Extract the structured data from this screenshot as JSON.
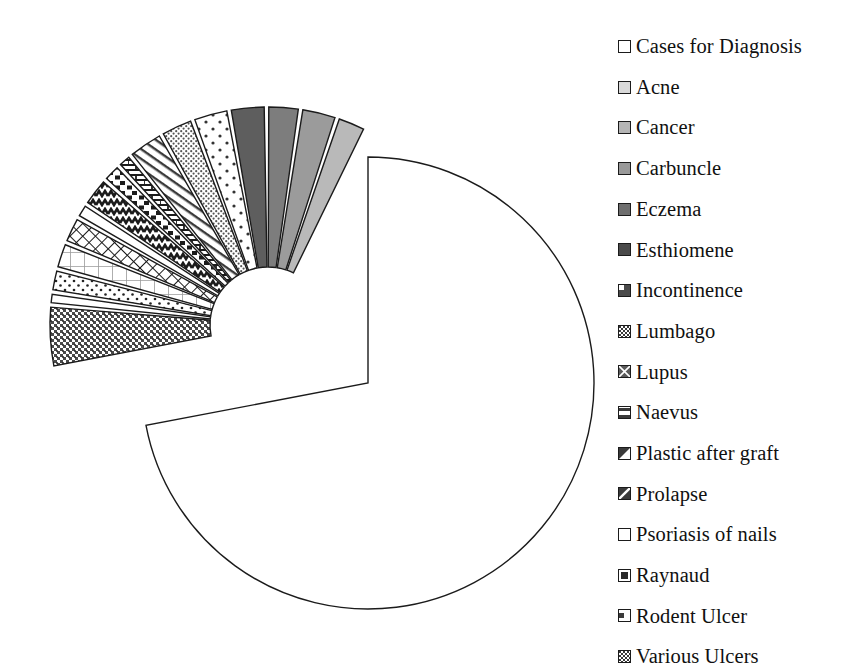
{
  "chart_data": {
    "type": "pie",
    "title": "",
    "xlabel": "",
    "ylabel": "",
    "legend_position": "right",
    "grid": false,
    "exploded": true,
    "start_angle_deg": 0,
    "direction": "clockwise",
    "categories": [
      "Cases for Diagnosis",
      "Acne",
      "Cancer",
      "Carbuncle",
      "Eczema",
      "Esthiomene",
      "Incontinence",
      "Lumbago",
      "Lupus",
      "Naevus",
      "Plastic after graft",
      "Prolapse",
      "Psoriasis of nails",
      "Raynaud",
      "Rodent Ulcer",
      "Various Ulcers"
    ],
    "values": [
      72.0,
      1.9,
      2.2,
      2.4,
      2.6,
      2.2,
      2.4,
      0.8,
      1.1,
      1.9,
      0.8,
      1.7,
      1.7,
      1.4,
      0.6,
      4.3
    ],
    "units": "percent"
  },
  "chart": {
    "center_x": 368,
    "center_y": 383,
    "radius": 226,
    "explode_center_x": 268,
    "explode_center_y": 325,
    "explode_radius": 218,
    "inner_gap": 58,
    "slices": [
      {
        "name": "Cases for Diagnosis",
        "start": 0,
        "end": 259.2,
        "fill": "white",
        "exploded": false
      },
      {
        "name": "Various Ulcers",
        "start": 259.2,
        "end": 274.7,
        "fill": "checker",
        "exploded": true
      },
      {
        "name": "Rodent Ulcer",
        "start": 275.9,
        "end": 278.1,
        "fill": "white",
        "exploded": true
      },
      {
        "name": "Raynaud",
        "start": 279.3,
        "end": 284.3,
        "fill": "dots-dense",
        "exploded": true
      },
      {
        "name": "Psoriasis of nails",
        "start": 285.5,
        "end": 291.6,
        "fill": "grid-light",
        "exploded": true
      },
      {
        "name": "Prolapse",
        "start": 292.8,
        "end": 298.9,
        "fill": "lattice",
        "exploded": true
      },
      {
        "name": "Plastic after graft",
        "start": 300.1,
        "end": 303.0,
        "fill": "white",
        "exploded": true
      },
      {
        "name": "Naevus",
        "start": 304.2,
        "end": 311.0,
        "fill": "zigzag",
        "exploded": true
      },
      {
        "name": "Lupus",
        "start": 312.2,
        "end": 316.2,
        "fill": "dash",
        "exploded": true
      },
      {
        "name": "Lumbago",
        "start": 317.4,
        "end": 320.3,
        "fill": "brick",
        "exploded": true
      },
      {
        "name": "Incontinence",
        "start": 321.5,
        "end": 330.1,
        "fill": "diag-line",
        "exploded": true
      },
      {
        "name": "Esthiomene",
        "start": 331.3,
        "end": 339.2,
        "fill": "stipple",
        "exploded": true
      },
      {
        "name": "Eczema",
        "start": 340.4,
        "end": 349.1,
        "fill": "dots-wide",
        "exploded": true
      },
      {
        "name": "Carbuncle",
        "start": 350.3,
        "end": 359.0,
        "fill": "#5e5e5e",
        "exploded": true
      },
      {
        "name": "Cancer",
        "start": 360.2,
        "end": 368.0,
        "fill": "#7d7d7d",
        "exploded": true
      },
      {
        "name": "Acne",
        "start": 369.2,
        "end": 377.9,
        "fill": "#9b9b9b",
        "exploded": true
      },
      {
        "name": "Acne2",
        "start": 379.1,
        "end": 386.0,
        "fill": "#b9b9b9",
        "exploded": true
      }
    ]
  },
  "legend": {
    "items": [
      {
        "label": "Cases for Diagnosis",
        "swatch": "white"
      },
      {
        "label": "Acne",
        "swatch": "#d9d9d9"
      },
      {
        "label": "Cancer",
        "swatch": "#b5b5b5"
      },
      {
        "label": "Carbuncle",
        "swatch": "#999999"
      },
      {
        "label": "Eczema",
        "swatch": "#6e6e6e"
      },
      {
        "label": "Esthiomene",
        "swatch": "#4a4a4a"
      },
      {
        "label": "Incontinence",
        "swatch": "corner-dark"
      },
      {
        "label": "Lumbago",
        "swatch": "checker"
      },
      {
        "label": "Lupus",
        "swatch": "lattice"
      },
      {
        "label": "Naevus",
        "swatch": "band"
      },
      {
        "label": "Plastic after graft",
        "swatch": "tri-dark"
      },
      {
        "label": "Prolapse",
        "swatch": "diag-dark"
      },
      {
        "label": "Psoriasis of nails",
        "swatch": "white"
      },
      {
        "label": "Raynaud",
        "swatch": "center-dark"
      },
      {
        "label": "Rodent Ulcer",
        "swatch": "notch"
      },
      {
        "label": "Various Ulcers",
        "swatch": "checker2"
      }
    ]
  },
  "colors": {
    "outline": "#1b1b1b",
    "background": "#ffffff",
    "text": "#101010"
  }
}
